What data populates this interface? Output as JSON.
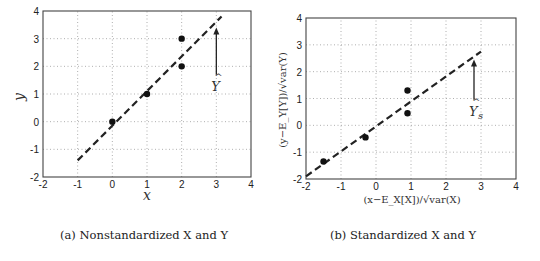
{
  "figure": {
    "panel_a": {
      "caption": "(a) Nonstandardized X and Y",
      "xlabel": "x",
      "ylabel": "y",
      "annotation": "Ŷ"
    },
    "panel_b": {
      "caption": "(b) Standardized X and Y",
      "xlabel": "(x−E_X[X])/√var(X)",
      "ylabel": "(y−E_Y[Y])/√var(Y)",
      "annotation": "Ŷs"
    }
  },
  "chart_data": [
    {
      "type": "scatter",
      "title": "(a) Nonstandardized X and Y",
      "xlabel": "x",
      "ylabel": "y",
      "xlim": [
        -2,
        4
      ],
      "ylim": [
        -2,
        4
      ],
      "xticks": [
        -2,
        -1,
        0,
        1,
        2,
        3,
        4
      ],
      "yticks": [
        -2,
        -1,
        0,
        1,
        2,
        3,
        4
      ],
      "grid": true,
      "points": [
        {
          "x": 0,
          "y": 0
        },
        {
          "x": 1,
          "y": 1
        },
        {
          "x": 2,
          "y": 2
        },
        {
          "x": 2,
          "y": 3
        }
      ],
      "fit_line": {
        "style": "dashed",
        "x": [
          -1,
          3.15
        ],
        "y": [
          -1.4,
          3.8
        ]
      },
      "annotations": [
        {
          "text": "Ŷ",
          "arrow_x": 3,
          "arrow_from_y": 1.7,
          "arrow_to_y": 3.4
        }
      ]
    },
    {
      "type": "scatter",
      "title": "(b) Standardized X and Y",
      "xlabel": "(x−E_X[X])/√var(X)",
      "ylabel": "(y−E_Y[Y])/√var(Y)",
      "xlim": [
        -2,
        4
      ],
      "ylim": [
        -2,
        4
      ],
      "xticks": [
        -2,
        -1,
        0,
        1,
        2,
        3,
        4
      ],
      "yticks": [
        -2,
        -1,
        0,
        1,
        2,
        3,
        4
      ],
      "grid": true,
      "points": [
        {
          "x": -1.5,
          "y": -1.35
        },
        {
          "x": -0.3,
          "y": -0.45
        },
        {
          "x": 0.9,
          "y": 0.45
        },
        {
          "x": 0.9,
          "y": 1.3
        }
      ],
      "fit_line": {
        "style": "dashed",
        "x": [
          -2,
          3
        ],
        "y": [
          -1.9,
          2.75
        ]
      },
      "annotations": [
        {
          "text": "Ŷs",
          "arrow_x": 2.8,
          "arrow_from_y": 0.95,
          "arrow_to_y": 2.45
        }
      ]
    }
  ]
}
